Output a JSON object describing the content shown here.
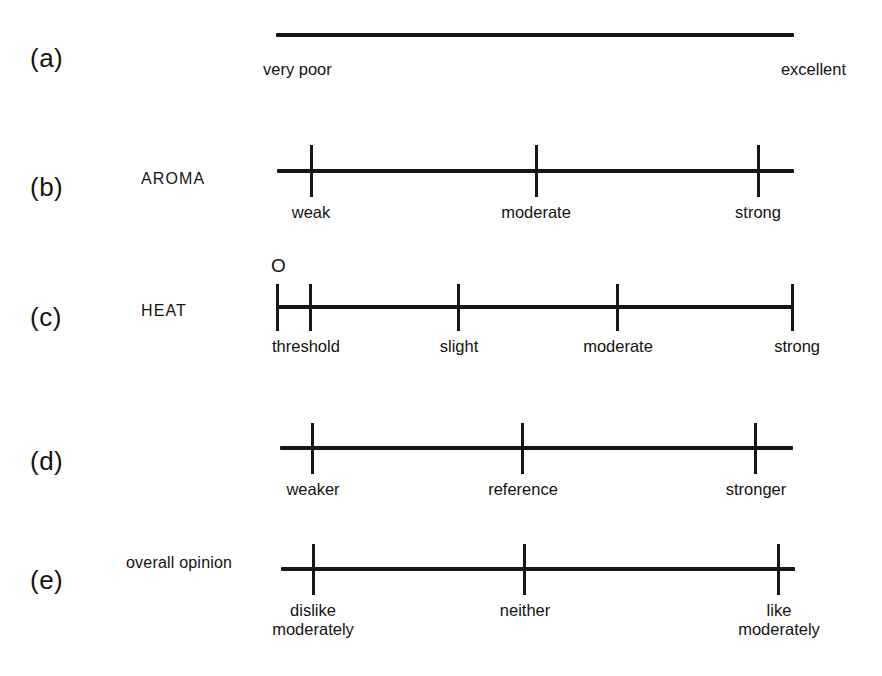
{
  "figure": {
    "background_color": "#ffffff",
    "ink_color": "#161616"
  },
  "rows": [
    {
      "id": "row-a",
      "letter": "(a)",
      "attribute": "",
      "marker": null,
      "anchors": [
        {
          "label": "very poor",
          "align": "left-edge"
        },
        {
          "label": "excellent",
          "align": "right-edge"
        }
      ],
      "ticks": []
    },
    {
      "id": "row-b",
      "letter": "(b)",
      "attribute": "AROMA",
      "marker": null,
      "anchors": [
        {
          "label": "weak",
          "align": "center"
        },
        {
          "label": "moderate",
          "align": "center"
        },
        {
          "label": "strong",
          "align": "center"
        }
      ],
      "ticks": [
        311,
        536,
        758
      ]
    },
    {
      "id": "row-c",
      "letter": "(c)",
      "attribute": "HEAT",
      "marker": "O",
      "anchors": [
        {
          "label": "threshold",
          "align": "center"
        },
        {
          "label": "slight",
          "align": "center"
        },
        {
          "label": "moderate",
          "align": "center"
        },
        {
          "label": "strong",
          "align": "center"
        }
      ],
      "ticks": [
        277,
        310,
        458,
        617,
        792
      ]
    },
    {
      "id": "row-d",
      "letter": "(d)",
      "attribute": "",
      "marker": null,
      "anchors": [
        {
          "label": "weaker",
          "align": "center"
        },
        {
          "label": "reference",
          "align": "center"
        },
        {
          "label": "stronger",
          "align": "center"
        }
      ],
      "ticks": [
        312,
        522,
        755
      ]
    },
    {
      "id": "row-e",
      "letter": "(e)",
      "attribute": "overall opinion",
      "marker": null,
      "anchors": [
        {
          "label": "dislike",
          "label2": "moderately",
          "align": "center"
        },
        {
          "label": "neither",
          "align": "center"
        },
        {
          "label": "like",
          "label2": "moderately",
          "align": "center"
        }
      ],
      "ticks": [
        313,
        524,
        778
      ]
    }
  ],
  "labels": {
    "a_letter": "(a)",
    "b_letter": "(b)",
    "c_letter": "(c)",
    "d_letter": "(d)",
    "e_letter": "(e)",
    "aroma": "AROMA",
    "heat": "HEAT",
    "overall_opinion": "overall opinion",
    "marker_o": "O",
    "a_left": "very poor",
    "a_right": "excellent",
    "b_1": "weak",
    "b_2": "moderate",
    "b_3": "strong",
    "c_1": "threshold",
    "c_2": "slight",
    "c_3": "moderate",
    "c_4": "strong",
    "d_1": "weaker",
    "d_2": "reference",
    "d_3": "stronger",
    "e_1a": "dislike",
    "e_1b": "moderately",
    "e_2": "neither",
    "e_3a": "like",
    "e_3b": "moderately"
  }
}
